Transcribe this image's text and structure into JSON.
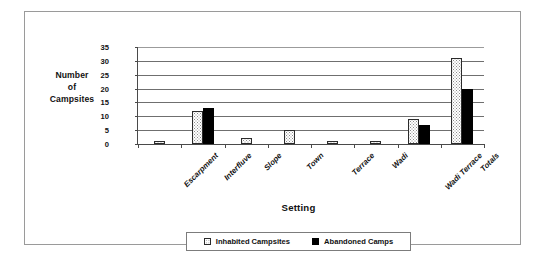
{
  "chart_data": {
    "type": "bar",
    "title": "",
    "xlabel": "Setting",
    "ylabel": "Number of Campsites",
    "ylabel_lines": [
      "Number",
      "of",
      "Campsites"
    ],
    "categories": [
      "Escarpment",
      "Interfluve",
      "Slope",
      "Town",
      "Terrace",
      "Wadi",
      "Wadi Terrace",
      "Totals"
    ],
    "series": [
      {
        "name": "Inhabited Campsites",
        "values": [
          1,
          12,
          2,
          5,
          1,
          1,
          9,
          31
        ],
        "color": "#ffffff",
        "pattern": "dotted"
      },
      {
        "name": "Abandoned Camps",
        "values": [
          0,
          13,
          0,
          0,
          0,
          0,
          7,
          20
        ],
        "color": "#000000",
        "pattern": "solid"
      }
    ],
    "ylim": [
      0,
      35
    ],
    "ytick_values": [
      0,
      5,
      10,
      15,
      20,
      25,
      30,
      35
    ],
    "ytick_labels": [
      "0",
      "5",
      "10",
      "15",
      "20",
      "25",
      "30",
      "35"
    ],
    "grid": true,
    "legend_position": "bottom-center"
  }
}
